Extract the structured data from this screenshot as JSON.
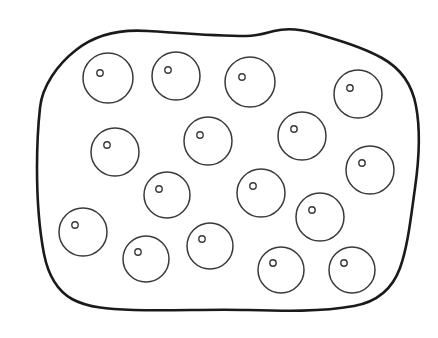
{
  "figure": {
    "background_color": "#ffffff",
    "outline_color": "#1a1a1a",
    "circle_stroke_color": "#3a3a3a",
    "dot_stroke_color": "#3a3a3a",
    "item_count": 16,
    "outline_name": "blob-outline",
    "outline_path": "M 40 108 C 42 86 58 64 76 50 C 96 34 120 29 148 31 C 180 33 214 36 246 36 C 258 36 266 33 274 31 C 286 28 300 29 314 33 C 338 40 362 47 382 58 C 400 68 412 84 416 106 C 421 132 419 160 415 188 C 411 216 408 246 400 268 C 392 290 376 302 354 306 C 320 312 284 311 248 310 C 210 309 172 311 134 310 C 110 309 88 308 72 299 C 56 290 48 274 44 254 C 39 228 37 198 37 168 C 37 146 38 126 40 108 Z",
    "circles": [
      {
        "id": 1,
        "cx": 108,
        "cy": 78,
        "r": 25,
        "dot_cx": 100,
        "dot_cy": 73,
        "dot_r": 3.2
      },
      {
        "id": 2,
        "cx": 176,
        "cy": 76,
        "r": 24,
        "dot_cx": 168,
        "dot_cy": 70,
        "dot_r": 3.2
      },
      {
        "id": 3,
        "cx": 250,
        "cy": 82,
        "r": 25,
        "dot_cx": 242,
        "dot_cy": 77,
        "dot_r": 3.2
      },
      {
        "id": 4,
        "cx": 358,
        "cy": 94,
        "r": 24,
        "dot_cx": 350,
        "dot_cy": 88,
        "dot_r": 3.2
      },
      {
        "id": 5,
        "cx": 115,
        "cy": 152,
        "r": 24,
        "dot_cx": 107,
        "dot_cy": 145,
        "dot_r": 3.2
      },
      {
        "id": 6,
        "cx": 208,
        "cy": 141,
        "r": 24,
        "dot_cx": 200,
        "dot_cy": 135,
        "dot_r": 3.2
      },
      {
        "id": 7,
        "cx": 302,
        "cy": 136,
        "r": 24,
        "dot_cx": 294,
        "dot_cy": 129,
        "dot_r": 3.2
      },
      {
        "id": 8,
        "cx": 370,
        "cy": 170,
        "r": 24,
        "dot_cx": 362,
        "dot_cy": 163,
        "dot_r": 3.2
      },
      {
        "id": 9,
        "cx": 167,
        "cy": 195,
        "r": 23,
        "dot_cx": 159,
        "dot_cy": 189,
        "dot_r": 3.2
      },
      {
        "id": 10,
        "cx": 261,
        "cy": 193,
        "r": 24,
        "dot_cx": 253,
        "dot_cy": 186,
        "dot_r": 3.2
      },
      {
        "id": 11,
        "cx": 320,
        "cy": 217,
        "r": 24,
        "dot_cx": 312,
        "dot_cy": 210,
        "dot_r": 3.2
      },
      {
        "id": 12,
        "cx": 83,
        "cy": 232,
        "r": 24,
        "dot_cx": 75,
        "dot_cy": 225,
        "dot_r": 3.2
      },
      {
        "id": 13,
        "cx": 146,
        "cy": 259,
        "r": 23,
        "dot_cx": 138,
        "dot_cy": 252,
        "dot_r": 3.2
      },
      {
        "id": 14,
        "cx": 210,
        "cy": 246,
        "r": 23,
        "dot_cx": 202,
        "dot_cy": 239,
        "dot_r": 3.2
      },
      {
        "id": 15,
        "cx": 281,
        "cy": 270,
        "r": 23,
        "dot_cx": 273,
        "dot_cy": 263,
        "dot_r": 3.2
      },
      {
        "id": 16,
        "cx": 352,
        "cy": 270,
        "r": 23,
        "dot_cx": 344,
        "dot_cy": 263,
        "dot_r": 3.2
      }
    ]
  }
}
